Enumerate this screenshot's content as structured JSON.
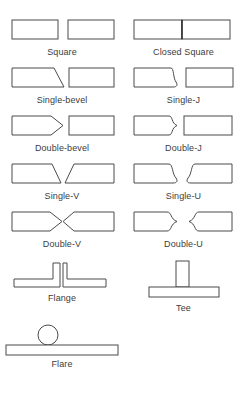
{
  "diagram": {
    "stroke_color": "#4a4a4a",
    "fill_color": "#ffffff",
    "text_color": "#3d3d3d",
    "background": "#ffffff",
    "rows": [
      {
        "left": {
          "label": "Square",
          "shape": "square-butt"
        },
        "right": {
          "label": "Closed Square",
          "shape": "closed-square-butt"
        }
      },
      {
        "left": {
          "label": "Single-bevel",
          "shape": "single-bevel"
        },
        "right": {
          "label": "Single-J",
          "shape": "single-j"
        }
      },
      {
        "left": {
          "label": "Double-bevel",
          "shape": "double-bevel"
        },
        "right": {
          "label": "Double-J",
          "shape": "double-j"
        }
      },
      {
        "left": {
          "label": "Single-V",
          "shape": "single-v"
        },
        "right": {
          "label": "Single-U",
          "shape": "single-u"
        }
      },
      {
        "left": {
          "label": "Double-V",
          "shape": "double-v"
        },
        "right": {
          "label": "Double-U",
          "shape": "double-u"
        }
      },
      {
        "left": {
          "label": "Flange",
          "shape": "flange"
        },
        "right": {
          "label": "Tee",
          "shape": "tee"
        }
      },
      {
        "left": {
          "label": "Flare",
          "shape": "flare"
        },
        "right": {
          "label": "",
          "shape": "none"
        }
      }
    ]
  }
}
